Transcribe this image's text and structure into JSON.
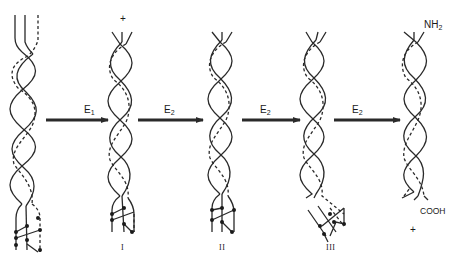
{
  "diagram": {
    "colors": {
      "stroke": "#2a2a2a",
      "background": "#ffffff"
    },
    "structures": [
      {
        "id": "start",
        "label": "",
        "top_mark": "",
        "x": 23
      },
      {
        "id": "I",
        "label": "I",
        "top_mark": "+",
        "x": 120
      },
      {
        "id": "II",
        "label": "II",
        "top_mark": "",
        "x": 222
      },
      {
        "id": "III",
        "label": "III",
        "top_mark": "",
        "x": 313
      },
      {
        "id": "final",
        "label": "",
        "top_mark": "",
        "x": 418
      }
    ],
    "arrows": [
      {
        "enzyme": "E",
        "subscript": "1"
      },
      {
        "enzyme": "E",
        "subscript": "2"
      },
      {
        "enzyme": "E",
        "subscript": "2"
      },
      {
        "enzyme": "E",
        "subscript": "2"
      }
    ],
    "annotations": {
      "amino_terminus": {
        "base": "NH",
        "subscript": "2"
      },
      "carboxy_terminus": "COOH",
      "released_plus": "+"
    }
  }
}
